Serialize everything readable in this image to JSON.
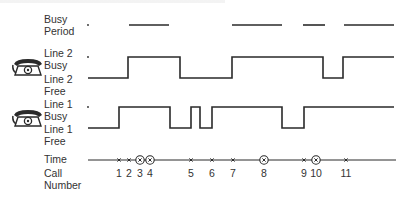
{
  "figure": {
    "rows": {
      "busy_period": {
        "label_line1": "Busy",
        "label_line2": "Period"
      },
      "line2": {
        "busy_line1": "Line 2",
        "busy_line2": "Busy",
        "free_line1": "Line 2",
        "free_line2": "Free",
        "icon": "telephone-icon"
      },
      "line1": {
        "busy_line1": "Line 1",
        "busy_line2": "Busy",
        "free_line1": "Line 1",
        "free_line2": "Free",
        "icon": "telephone-icon"
      },
      "time": {
        "label": "Time"
      },
      "call_number": {
        "label_line1": "Call",
        "label_line2": "Number"
      }
    },
    "calls": [
      {
        "number": "1",
        "x": 119,
        "circled": false
      },
      {
        "number": "2",
        "x": 129,
        "circled": false
      },
      {
        "number": "3",
        "x": 140,
        "circled": true
      },
      {
        "number": "4",
        "x": 150,
        "circled": true
      },
      {
        "number": "5",
        "x": 191,
        "circled": false
      },
      {
        "number": "6",
        "x": 212,
        "circled": false
      },
      {
        "number": "7",
        "x": 233,
        "circled": false
      },
      {
        "number": "8",
        "x": 264,
        "circled": true
      },
      {
        "number": "9",
        "x": 304,
        "circled": false
      },
      {
        "number": "10",
        "x": 316,
        "circled": true
      },
      {
        "number": "11",
        "x": 346,
        "circled": false
      }
    ],
    "busy_periods": [
      [
        129,
        169
      ],
      [
        232,
        282
      ],
      [
        303,
        325
      ],
      [
        344,
        394
      ]
    ],
    "line2_wave": {
      "y_busy": 57,
      "y_free": 78,
      "x_start": 88,
      "transitions": [
        [
          128,
          "busy"
        ],
        [
          180,
          "free"
        ],
        [
          232,
          "busy"
        ],
        [
          323,
          "free"
        ],
        [
          343,
          "busy"
        ]
      ],
      "x_end": 394
    },
    "line1_wave": {
      "y_busy": 107,
      "y_free": 128,
      "x_start": 88,
      "transitions": [
        [
          119,
          "busy"
        ],
        [
          170,
          "free"
        ],
        [
          191,
          "busy"
        ],
        [
          200,
          "free"
        ],
        [
          212,
          "busy"
        ],
        [
          282,
          "free"
        ],
        [
          304,
          "busy"
        ]
      ],
      "x_end": 394
    },
    "time_axis": {
      "y": 160,
      "x_start": 88,
      "x_end": 396
    },
    "colors": {
      "ink": "#2a2a2a",
      "text": "#333333",
      "background": "#ffffff"
    }
  }
}
